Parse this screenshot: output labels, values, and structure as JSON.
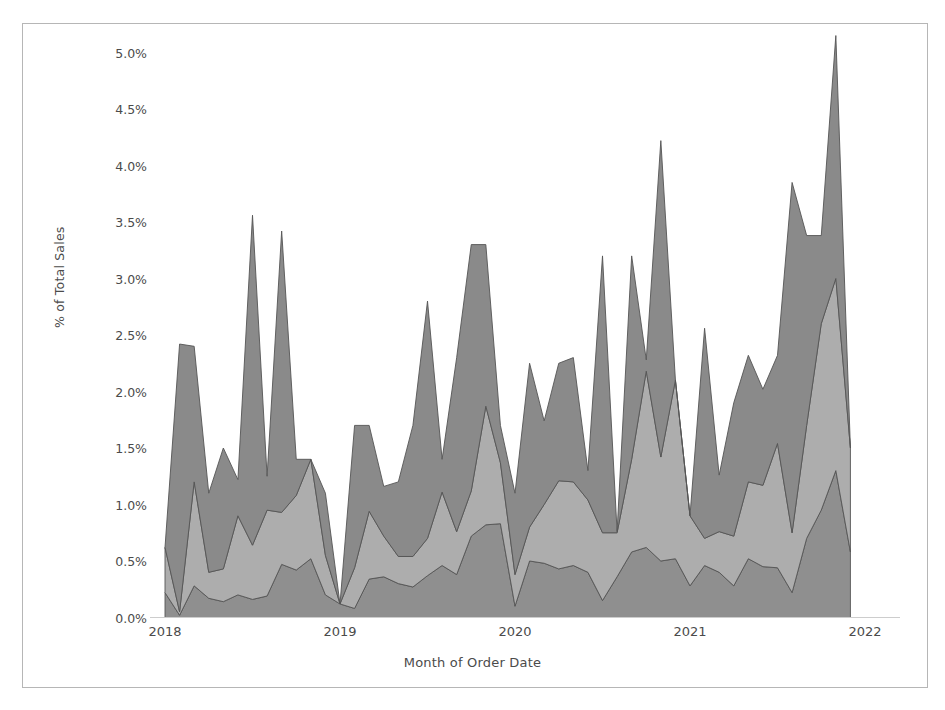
{
  "chart_data": {
    "type": "area",
    "title": "",
    "subtitle": "",
    "xlabel": "Month of Order Date",
    "ylabel": "% of Total Sales",
    "stacked": true,
    "grid": false,
    "legend_position": "none",
    "ylim": [
      0.0,
      5.25
    ],
    "y_ticks": [
      "0.0%",
      "0.5%",
      "1.0%",
      "1.5%",
      "2.0%",
      "2.5%",
      "3.0%",
      "3.5%",
      "4.0%",
      "4.5%",
      "5.0%"
    ],
    "y_tick_values": [
      0.0,
      0.5,
      1.0,
      1.5,
      2.0,
      2.5,
      3.0,
      3.5,
      4.0,
      4.5,
      5.0
    ],
    "x_ticks": [
      "2018",
      "2019",
      "2020",
      "2021",
      "2022"
    ],
    "x_tick_values": [
      2018,
      2019,
      2020,
      2021,
      2022
    ],
    "xlim": [
      2018.0,
      2022.0
    ],
    "x": [
      "2018-01",
      "2018-02",
      "2018-03",
      "2018-04",
      "2018-05",
      "2018-06",
      "2018-07",
      "2018-08",
      "2018-09",
      "2018-10",
      "2018-11",
      "2018-12",
      "2019-01",
      "2019-02",
      "2019-03",
      "2019-04",
      "2019-05",
      "2019-06",
      "2019-07",
      "2019-08",
      "2019-09",
      "2019-10",
      "2019-11",
      "2019-12",
      "2020-01",
      "2020-02",
      "2020-03",
      "2020-04",
      "2020-05",
      "2020-06",
      "2020-07",
      "2020-08",
      "2020-09",
      "2020-10",
      "2020-11",
      "2020-12",
      "2021-01",
      "2021-02",
      "2021-03",
      "2021-04",
      "2021-05",
      "2021-06",
      "2021-07",
      "2021-08",
      "2021-09",
      "2021-10",
      "2021-11",
      "2021-12"
    ],
    "series": [
      {
        "name": "Series 1",
        "color": "#8f8f8f",
        "values": [
          0.22,
          0.02,
          0.28,
          0.17,
          0.14,
          0.2,
          0.16,
          0.19,
          0.47,
          0.42,
          0.52,
          0.2,
          0.12,
          0.08,
          0.34,
          0.36,
          0.3,
          0.27,
          0.37,
          0.46,
          0.38,
          0.72,
          0.82,
          0.83,
          0.1,
          0.5,
          0.48,
          0.43,
          0.46,
          0.4,
          0.15,
          0.36,
          0.58,
          0.62,
          0.5,
          0.52,
          0.28,
          0.46,
          0.4,
          0.28,
          0.52,
          0.45,
          0.44,
          0.22,
          0.7,
          0.95,
          1.3,
          0.58
        ]
      },
      {
        "name": "Series 2",
        "color": "#adadad",
        "values": [
          0.4,
          0.03,
          0.92,
          0.23,
          0.29,
          0.7,
          0.48,
          0.76,
          0.46,
          0.66,
          0.88,
          0.35,
          0.0,
          0.36,
          0.6,
          0.36,
          0.24,
          0.27,
          0.33,
          0.65,
          0.38,
          0.4,
          1.05,
          0.54,
          0.28,
          0.3,
          0.52,
          0.78,
          0.74,
          0.64,
          0.6,
          0.39,
          0.82,
          1.56,
          0.92,
          1.58,
          0.62,
          0.24,
          0.36,
          0.44,
          0.68,
          0.72,
          1.1,
          0.53,
          1.0,
          1.65,
          1.7,
          0.92
        ]
      },
      {
        "name": "Series 3",
        "color": "#8a8a8a",
        "values": [
          0.0,
          2.37,
          1.2,
          0.7,
          1.07,
          0.32,
          2.92,
          0.3,
          2.49,
          0.32,
          0.0,
          0.55,
          0.0,
          1.26,
          0.76,
          0.44,
          0.66,
          1.16,
          2.1,
          0.29,
          1.54,
          2.18,
          1.43,
          0.33,
          0.72,
          1.45,
          0.74,
          1.04,
          1.1,
          0.26,
          2.45,
          0.01,
          1.8,
          0.1,
          2.8,
          0.0,
          0.0,
          1.86,
          0.5,
          1.18,
          1.12,
          0.85,
          0.78,
          3.1,
          1.68,
          0.78,
          2.15,
          0.0
        ]
      }
    ],
    "totals_note_max": 5.15,
    "frame_border_color": "#b6b6b6",
    "text_color": "#4b4b4b",
    "background_color": "#ffffff"
  }
}
